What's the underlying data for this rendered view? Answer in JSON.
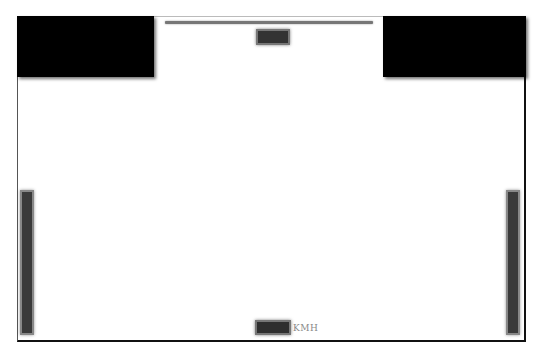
{
  "hud": {
    "top_bar": {
      "name": "top-progress-bar",
      "color": "#777777"
    },
    "top_indicator": {
      "name": "top-indicator",
      "color": "#333333"
    },
    "corner_panels": [
      {
        "position": "top-left",
        "color": "#000000"
      },
      {
        "position": "top-right",
        "color": "#000000"
      }
    ],
    "side_gauges": [
      {
        "position": "left",
        "color": "#3a3a3a"
      },
      {
        "position": "right",
        "color": "#3a3a3a"
      }
    ],
    "speedometer": {
      "value": "",
      "unit": "KMH"
    }
  },
  "colors": {
    "background": "#ffffff",
    "frame_border": "#111111",
    "panel": "#000000"
  }
}
